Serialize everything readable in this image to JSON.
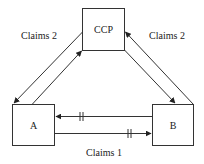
{
  "diagram": {
    "nodes": {
      "ccp": {
        "label": "CCP"
      },
      "a": {
        "label": "A"
      },
      "b": {
        "label": "B"
      }
    },
    "edges": {
      "ccp_a_label": "Claims 2",
      "ccp_b_label": "Claims 2",
      "a_b_label": "Claims 1"
    },
    "colors": {
      "stroke": "#333333",
      "background": "#ffffff",
      "text": "#222222"
    }
  }
}
